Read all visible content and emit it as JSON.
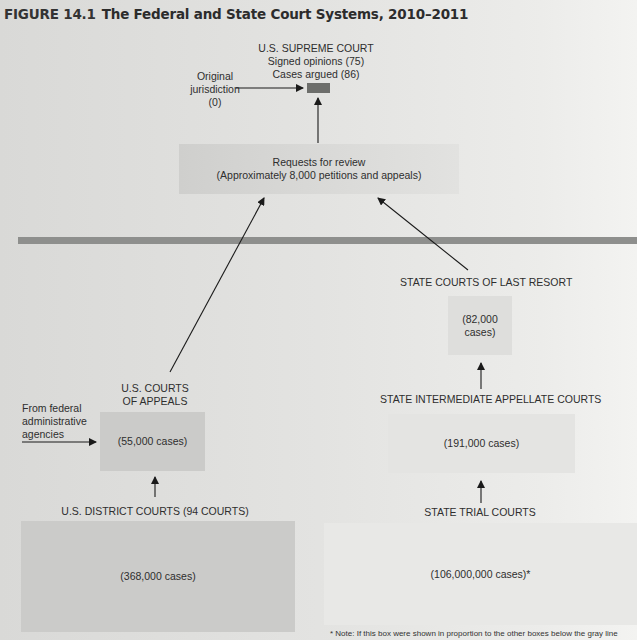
{
  "figure": {
    "number": "FIGURE 14.1",
    "title": "The Federal and State Court Systems, 2010–2011"
  },
  "supreme_court": {
    "name": "U.S. SUPREME COURT",
    "signed_opinions": "Signed opinions (75)",
    "cases_argued": "Cases argued (86)",
    "box_color": "#6d6e6b"
  },
  "original_jurisdiction": {
    "line1": "Original",
    "line2": "jurisdiction",
    "line3": "(0)"
  },
  "requests_for_review": {
    "line1": "Requests for review",
    "line2": "(Approximately 8,000 petitions and appeals)"
  },
  "federal": {
    "courts_of_appeals": {
      "label_line1": "U.S. COURTS",
      "label_line2": "OF APPEALS",
      "cases": "(55,000 cases)"
    },
    "administrative_agencies": {
      "line1": "From federal",
      "line2": "administrative",
      "line3": "agencies"
    },
    "district_courts": {
      "label": "U.S. DISTRICT COURTS (94 COURTS)",
      "cases": "(368,000 cases)"
    }
  },
  "state": {
    "last_resort": {
      "label": "STATE COURTS OF LAST RESORT",
      "cases_line1": "(82,000",
      "cases_line2": "cases)"
    },
    "intermediate_appellate": {
      "label": "STATE INTERMEDIATE APPELLATE COURTS",
      "cases": "(191,000 cases)"
    },
    "trial_courts": {
      "label": "STATE TRIAL COURTS",
      "cases": "(106,000,000 cases)*"
    }
  },
  "footnote": "* Note: If this box were shown in proportion to the other boxes below the gray line",
  "colors": {
    "divider": "#8e8f8d",
    "federal_box": "#cbcbc9",
    "state_box": "#e6e6e4",
    "arrow": "#1a1a1a"
  }
}
